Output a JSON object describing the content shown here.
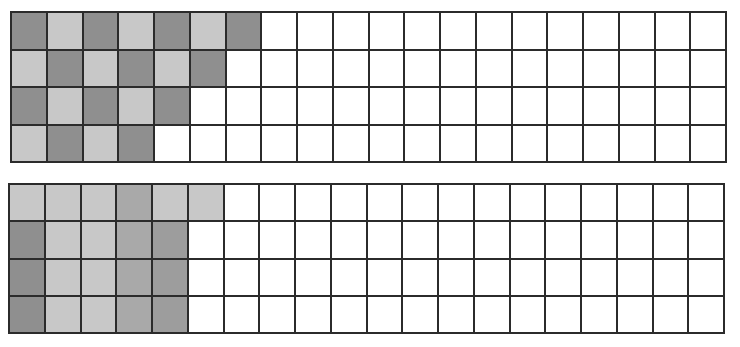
{
  "colors": {
    "empty": "#ffffff",
    "light": "#c8c8c8",
    "medium": "#a9a9a9",
    "medium_dark": "#9d9d9d",
    "dark": "#8f8f8f",
    "line": "#2b2b2b"
  },
  "grids": [
    {
      "name": "top-grid",
      "rows": 4,
      "cols": 20,
      "left": 10,
      "top": 11,
      "width": 717,
      "height": 152,
      "filled": [
        [
          "dark",
          "light",
          "dark",
          "light",
          "dark",
          "light",
          "dark"
        ],
        [
          "light",
          "dark",
          "light",
          "dark",
          "light",
          "dark"
        ],
        [
          "dark",
          "light",
          "dark",
          "light",
          "dark"
        ],
        [
          "light",
          "dark",
          "light",
          "dark"
        ]
      ]
    },
    {
      "name": "bottom-grid",
      "rows": 4,
      "cols": 20,
      "left": 8,
      "top": 183,
      "width": 717,
      "height": 151,
      "filled": [
        [
          "light",
          "light",
          "light",
          "medium",
          "light",
          "light"
        ],
        [
          "dark",
          "light",
          "light",
          "medium",
          "medium_dark"
        ],
        [
          "dark",
          "light",
          "light",
          "medium",
          "medium_dark"
        ],
        [
          "dark",
          "light",
          "light",
          "medium",
          "medium_dark"
        ]
      ]
    }
  ]
}
